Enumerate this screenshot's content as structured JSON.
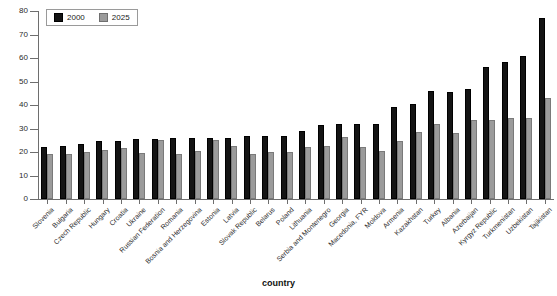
{
  "chart_data": {
    "type": "bar",
    "title": "",
    "xlabel": "country",
    "ylabel": "percent",
    "ylim": [
      0,
      80
    ],
    "ytick_step": 10,
    "yticks": [
      0,
      10,
      20,
      30,
      40,
      50,
      60,
      70,
      80
    ],
    "grid": false,
    "legend_position": "top-left",
    "categories": [
      "Slovenia",
      "Bulgaria",
      "Czech Republic",
      "Hungary",
      "Croatia",
      "Ukraine",
      "Russian Federation",
      "Romania",
      "Bosnia and Herzegovina",
      "Estonia",
      "Latvia",
      "Slovak Republic",
      "Belarus",
      "Poland",
      "Lithuania",
      "Serbia and Montenegro",
      "Georgia",
      "Macedonia, FYR",
      "Moldova",
      "Armenia",
      "Kazakhstan",
      "Turkey",
      "Albania",
      "Azerbaijan",
      "Kyrgyz Republic",
      "Turkmenistan",
      "Uzbekistan",
      "Tajikistan"
    ],
    "series": [
      {
        "name": "2000",
        "color": "#141414",
        "values": [
          22,
          22.5,
          23.5,
          24.5,
          24.5,
          25.5,
          25.5,
          26,
          26,
          26,
          26,
          27,
          27,
          27,
          29,
          31.5,
          32,
          32,
          32,
          39,
          40.5,
          46,
          45.5,
          47,
          56,
          58.5,
          61,
          77
        ]
      },
      {
        "name": "2025",
        "color": "#9b9b9b",
        "values": [
          19,
          19,
          20,
          21,
          21.5,
          19.5,
          25,
          19,
          20.5,
          25,
          22.5,
          19,
          20,
          20,
          22,
          22.5,
          26.5,
          22,
          20.5,
          24.5,
          28.5,
          32,
          28,
          33.5,
          33.5,
          34.5,
          34.5,
          43
        ]
      }
    ]
  },
  "legend": {
    "items": [
      {
        "label": "2000"
      },
      {
        "label": "2025"
      }
    ]
  },
  "axes": {
    "y_title": "percent",
    "x_title": "country"
  }
}
